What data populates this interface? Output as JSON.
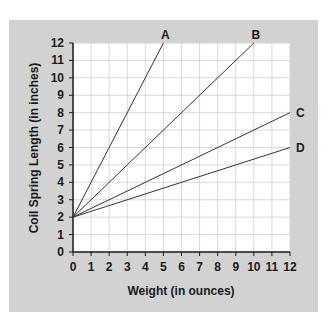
{
  "chart_data": {
    "type": "line",
    "title": "",
    "xlabel": "Weight (in ounces)",
    "ylabel": "Coil Spring Length (in inches)",
    "xlim": [
      0,
      12
    ],
    "ylim": [
      0,
      12
    ],
    "x_ticks": [
      0,
      1,
      2,
      3,
      4,
      5,
      6,
      7,
      8,
      9,
      10,
      11,
      12
    ],
    "y_ticks": [
      0,
      1,
      2,
      3,
      4,
      5,
      6,
      7,
      8,
      9,
      10,
      11,
      12
    ],
    "grid": true,
    "legend": "inline labels at line ends",
    "series": [
      {
        "name": "A",
        "x": [
          0,
          5
        ],
        "values": [
          2,
          12
        ]
      },
      {
        "name": "B",
        "x": [
          0,
          10
        ],
        "values": [
          2,
          12
        ]
      },
      {
        "name": "C",
        "x": [
          0,
          12
        ],
        "values": [
          2,
          8
        ]
      },
      {
        "name": "D",
        "x": [
          0,
          12
        ],
        "values": [
          2,
          6
        ]
      }
    ]
  },
  "colors": {
    "panel": "#d2d2d2",
    "plot_bg": "#ffffff",
    "grid": "#cfcfcf",
    "line": "#333333",
    "axis": "#1a1a1a"
  }
}
